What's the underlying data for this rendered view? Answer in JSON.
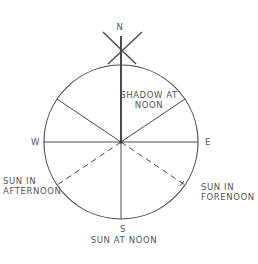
{
  "diagram": {
    "type": "sundial-compass",
    "colors": {
      "line": "#4a4a4a",
      "text": "#555555",
      "background": "#ffffff"
    },
    "geometry": {
      "center": [
        121,
        142
      ],
      "radius": 77
    },
    "labels": {
      "north": "N",
      "south": "S",
      "east": "E",
      "west": "W",
      "shadow_line1": "SHADOW AT",
      "shadow_line2": "NOON",
      "afternoon_line1": "SUN IN",
      "afternoon_line2": "AFTERNOON",
      "forenoon_line1": "SUN IN",
      "forenoon_line2": "FORENOON",
      "noon": "SUN AT NOON"
    }
  }
}
